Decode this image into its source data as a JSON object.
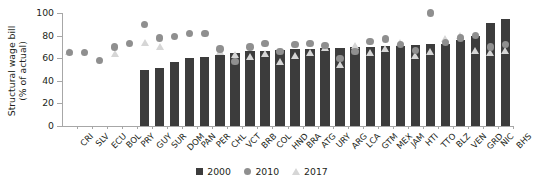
{
  "chart_data": {
    "type": "bar",
    "title": "",
    "xlabel": "",
    "ylabel": "Structural wage bill\n(% of actual)",
    "ylim": [
      0,
      100
    ],
    "yticks": [
      0,
      20,
      40,
      60,
      80,
      100
    ],
    "grid": false,
    "legend_position": "bottom-center",
    "categories": [
      "CRI",
      "SLV",
      "ECU",
      "BOL",
      "PRY",
      "GUY",
      "SUR",
      "DOM",
      "PAN",
      "PER",
      "CHL",
      "VCT",
      "BRB",
      "COL",
      "HND",
      "BRA",
      "ATG",
      "URY",
      "ARG",
      "LCA",
      "GTM",
      "MEX",
      "JAM",
      "HTI",
      "TTO",
      "BLZ",
      "VEN",
      "GRD",
      "NIC",
      "BHS"
    ],
    "series": [
      {
        "name": "2000",
        "marker": "square",
        "color": "#3c3c3c",
        "values": [
          null,
          null,
          null,
          null,
          null,
          50,
          51,
          57,
          60,
          61,
          63,
          65,
          66,
          66,
          67,
          68,
          68,
          69,
          69,
          70,
          70,
          71,
          71,
          72,
          73,
          73,
          76,
          80,
          91,
          95
        ]
      },
      {
        "name": "2010",
        "marker": "circle",
        "color": "#8f8f8f",
        "values": [
          65,
          65,
          58,
          70,
          73,
          90,
          78,
          79,
          82,
          82,
          68,
          57,
          70,
          73,
          66,
          72,
          73,
          71,
          60,
          66,
          75,
          77,
          72,
          67,
          100,
          74,
          78,
          80,
          70,
          72
        ]
      },
      {
        "name": "2017",
        "marker": "triangle",
        "color": "#d6d6d6",
        "values": [
          66,
          null,
          null,
          64,
          null,
          74,
          70,
          null,
          null,
          null,
          66,
          63,
          61,
          64,
          57,
          62,
          65,
          69,
          54,
          71,
          65,
          68,
          74,
          62,
          66,
          77,
          80,
          67,
          65,
          67
        ]
      }
    ]
  },
  "legend": {
    "items": [
      {
        "label": "2000",
        "marker": "square"
      },
      {
        "label": "2010",
        "marker": "circle"
      },
      {
        "label": "2017",
        "marker": "triangle"
      }
    ]
  },
  "axis": {
    "y_title": "Structural wage bill\n(% of actual)"
  }
}
